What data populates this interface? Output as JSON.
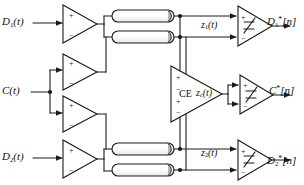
{
  "figure": {
    "type": "block-diagram",
    "width": 304,
    "height": 185,
    "background": "#ffffff",
    "line_color": "#1a1a1a",
    "fill_color": "#ffffff",
    "shade_color": "#bdbdbd"
  },
  "inputs": [
    {
      "id": "d1",
      "label": "D₁(t)",
      "base": "D",
      "subscript": "1",
      "arg": "(t)",
      "x": 4,
      "y": 16
    },
    {
      "id": "c",
      "label": "C(t)",
      "base": "C",
      "subscript": "",
      "arg": "(t)",
      "x": 4,
      "y": 84
    },
    {
      "id": "d2",
      "label": "D₂(t)",
      "base": "D",
      "subscript": "2",
      "arg": "(t)",
      "x": 4,
      "y": 151
    }
  ],
  "outputs": [
    {
      "id": "d1out",
      "label": "D₁*[n]",
      "base": "D",
      "subscript": "1",
      "star": "*",
      "arg": "[n]",
      "x": 268,
      "y": 16
    },
    {
      "id": "cout",
      "label": "C*[n]",
      "base": "C",
      "subscript": "",
      "star": "*",
      "arg": "[n]",
      "x": 270,
      "y": 85
    },
    {
      "id": "d2out",
      "label": "D₂*[n]",
      "base": "D",
      "subscript": "2",
      "star": "*",
      "arg": "[n]",
      "x": 268,
      "y": 155
    }
  ],
  "internal_signals": [
    {
      "id": "z1",
      "label": "z₁(t)",
      "base": "z",
      "subscript": "1",
      "arg": "(t)",
      "x": 203,
      "y": 20
    },
    {
      "id": "zc",
      "label": "z_c(t)",
      "base": "z",
      "subscript": "c",
      "arg": "(t)",
      "x": 196,
      "y": 88
    },
    {
      "id": "z2",
      "label": "z₂(t)",
      "base": "z",
      "subscript": "2",
      "arg": "(t)",
      "x": 203,
      "y": 148
    }
  ],
  "blocks": {
    "ce": {
      "label": "CE",
      "name": "crosstalk-equalizer",
      "x": 166,
      "y": 88
    }
  },
  "drivers": [
    {
      "id": "drv-d1",
      "name": "driver-d1",
      "plus": "+",
      "minus": "−"
    },
    {
      "id": "drv-c-top",
      "name": "driver-c-top",
      "plus": "+",
      "minus": "−"
    },
    {
      "id": "drv-c-bot",
      "name": "driver-c-bottom",
      "plus": "+",
      "minus": "−"
    },
    {
      "id": "drv-d2",
      "name": "driver-d2",
      "plus": "+",
      "minus": "−"
    }
  ],
  "slicers": [
    {
      "id": "slc-1",
      "name": "slicer-d1",
      "plus": "+",
      "minus": "−",
      "glyph": "step"
    },
    {
      "id": "slc-c",
      "name": "slicer-c",
      "plus": "+",
      "minus": "−",
      "glyph": "step"
    },
    {
      "id": "slc-2",
      "name": "slicer-d2",
      "plus": "+",
      "minus": "−",
      "glyph": "step"
    }
  ],
  "channels": [
    {
      "id": "ch1",
      "name": "transmission-line-1"
    },
    {
      "id": "ch2",
      "name": "transmission-line-2"
    },
    {
      "id": "ch3",
      "name": "transmission-line-3"
    },
    {
      "id": "ch4",
      "name": "transmission-line-4"
    }
  ]
}
